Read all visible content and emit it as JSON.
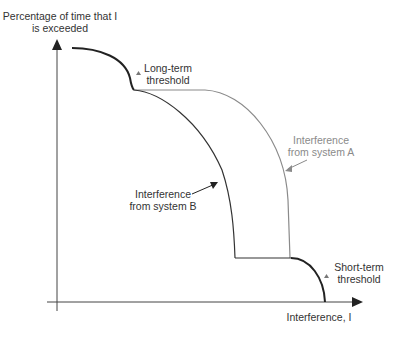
{
  "diagram": {
    "y_axis_label_line1": "Percentage of time that I",
    "y_axis_label_line2": "is exceeded",
    "x_axis_label": "Interference, I",
    "annotations": {
      "long_term_line1": "Long-term",
      "long_term_line2": "threshold",
      "short_term_line1": "Short-term",
      "short_term_line2": "threshold",
      "system_a_line1": "Interference",
      "system_a_line2": "from system A",
      "system_b_line1": "Interference",
      "system_b_line2": "from system B"
    },
    "colors": {
      "axis": "#333333",
      "threshold_curve": "#222222",
      "system_b": "#333333",
      "system_a": "#8a8a8a"
    }
  }
}
